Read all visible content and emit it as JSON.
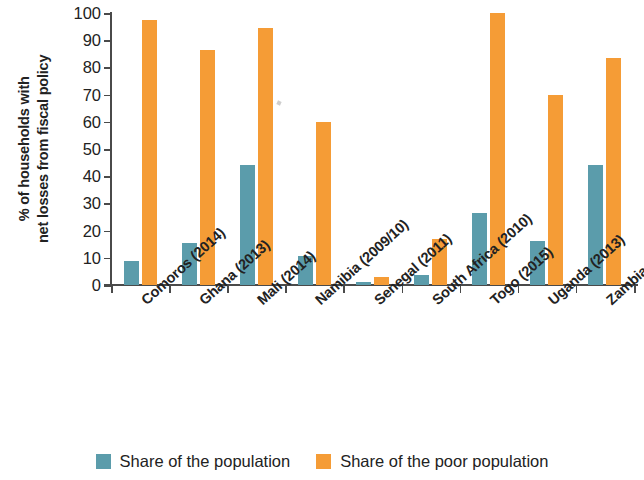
{
  "chart_data": {
    "type": "bar",
    "title": "",
    "xlabel": "",
    "ylabel": "% of households with net losses from fiscal policy",
    "ylabel_line1": "% of households with",
    "ylabel_line2": "net losses from fiscal policy",
    "ylim": [
      0,
      100
    ],
    "ytick_step": 10,
    "yticks": [
      0,
      10,
      20,
      30,
      40,
      50,
      60,
      70,
      80,
      90,
      100
    ],
    "ytick_labels": [
      "0",
      "10",
      "20",
      "30",
      "40",
      "50",
      "60",
      "70",
      "80",
      "90",
      "100"
    ],
    "grid": false,
    "legend_position": "bottom",
    "categories": [
      "Comoros (2014)",
      "Ghana (2013)",
      "Mali (2014)",
      "Namibia (2009/10)",
      "Senegal (2011)",
      "South Africa (2010)",
      "Togo (2015)",
      "Uganda (2013)",
      "Zambia (2015)"
    ],
    "series": [
      {
        "name": "Share of the population",
        "color": "#5b9cab",
        "values": [
          9,
          15.5,
          44,
          10.7,
          1,
          3.5,
          26.3,
          16,
          44
        ]
      },
      {
        "name": "Share of the poor population",
        "color": "#f59c36",
        "values": [
          97.3,
          86.5,
          94.5,
          60,
          3,
          17,
          100,
          70,
          83.5
        ]
      }
    ]
  },
  "legend": {
    "items": [
      {
        "label": "Share of the population",
        "color": "#5b9cab"
      },
      {
        "label": "Share of the poor population",
        "color": "#f59c36"
      }
    ]
  }
}
